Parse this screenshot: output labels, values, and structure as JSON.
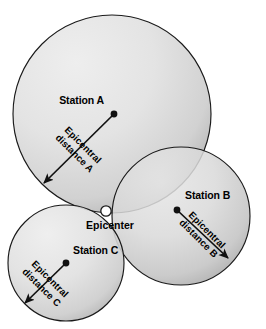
{
  "figure": {
    "kind": "earthquake-epicenter-triangulation-diagram",
    "background_color": "#ffffff",
    "circle_fill_light": "#e8e8e8",
    "circle_fill_dark": "#9d9d9d",
    "outline_color": "#1a1a1a",
    "text_color": "#000000",
    "epicenter_dot_fill": "#ffffff"
  },
  "epicenter": {
    "label": "Epicenter",
    "x": 106,
    "y": 211
  },
  "stations": [
    {
      "id": "A",
      "station_label": "Station A",
      "distance_label_line1": "Epicentral",
      "distance_label_line2": "distance A",
      "circle": {
        "cx": 112,
        "cy": 114,
        "r": 99
      },
      "dot": {
        "x": 114,
        "y": 114
      },
      "arrow": {
        "x1": 114,
        "y1": 114,
        "x2": 44,
        "y2": 183
      },
      "station_label_pos": {
        "x": 104,
        "y": 104,
        "anchor": "end"
      },
      "distance_label_rotation": 45,
      "distance_label_pos": {
        "x": 79,
        "y": 149
      }
    },
    {
      "id": "B",
      "station_label": "Station B",
      "distance_label_line1": "Epicentral",
      "distance_label_line2": "distance B",
      "circle": {
        "cx": 181,
        "cy": 216,
        "r": 69
      },
      "dot": {
        "x": 177,
        "y": 210
      },
      "arrow": {
        "x1": 177,
        "y1": 210,
        "x2": 228,
        "y2": 258
      },
      "station_label_pos": {
        "x": 185,
        "y": 199,
        "anchor": "start"
      },
      "distance_label_rotation": 45,
      "distance_label_pos": {
        "x": 203,
        "y": 234
      }
    },
    {
      "id": "C",
      "station_label": "Station C",
      "distance_label_line1": "Epicentral",
      "distance_label_line2": "distance C",
      "circle": {
        "cx": 66,
        "cy": 263,
        "r": 58
      },
      "dot": {
        "x": 66,
        "y": 263
      },
      "arrow": {
        "x1": 66,
        "y1": 263,
        "x2": 25,
        "y2": 303
      },
      "station_label_pos": {
        "x": 73,
        "y": 254,
        "anchor": "start"
      },
      "distance_label_rotation": 45,
      "distance_label_pos": {
        "x": 46,
        "y": 283
      }
    }
  ]
}
